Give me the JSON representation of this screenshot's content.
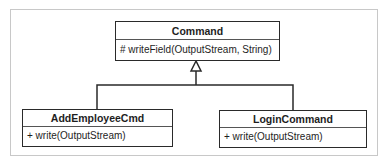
{
  "diagram": {
    "type": "UML class diagram",
    "classes": [
      {
        "name": "Command",
        "operations": [
          "# writeField(OutputStream, String)"
        ]
      },
      {
        "name": "AddEmployeeCmd",
        "operations": [
          "+ write(OutputStream)"
        ]
      },
      {
        "name": "LoginCommand",
        "operations": [
          "+ write(OutputStream)"
        ]
      }
    ],
    "relations": [
      {
        "type": "generalization",
        "from": "AddEmployeeCmd",
        "to": "Command"
      },
      {
        "type": "generalization",
        "from": "LoginCommand",
        "to": "Command"
      }
    ]
  },
  "colors": {
    "border": "#2a2a2a",
    "frame": "#c8c8c8",
    "background": "#ffffff"
  }
}
